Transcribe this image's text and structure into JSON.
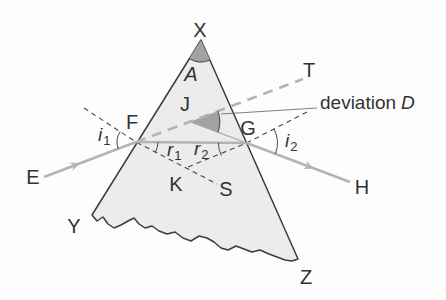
{
  "colors": {
    "background": "#fdfdfd",
    "prism-fill": "#ececec",
    "prism-stroke": "#3c3c3c",
    "ray": "#b4b4b4",
    "ray-thin": "#a8a8a8",
    "angle-fill": "#a2a2a2",
    "line-dark": "#474747",
    "text": "#333333",
    "pointer": "#6f6f6f"
  },
  "labels": {
    "apex": "X",
    "apex_angle": "A",
    "extended_ray_end": "T",
    "deviation_vertex": "J",
    "entry_point": "F",
    "exit_point": "G",
    "incident_source": "E",
    "emergent_end": "H",
    "normals_crossing": "K",
    "normal_end": "S",
    "base_left": "Y",
    "base_right": "Z"
  },
  "angles": {
    "i1": {
      "symbol": "i",
      "sub": "1"
    },
    "r1": {
      "symbol": "r",
      "sub": "1"
    },
    "r2": {
      "symbol": "r",
      "sub": "2"
    },
    "i2": {
      "symbol": "i",
      "sub": "2"
    }
  },
  "deviation_label": {
    "text": "deviation",
    "symbol": "D"
  }
}
